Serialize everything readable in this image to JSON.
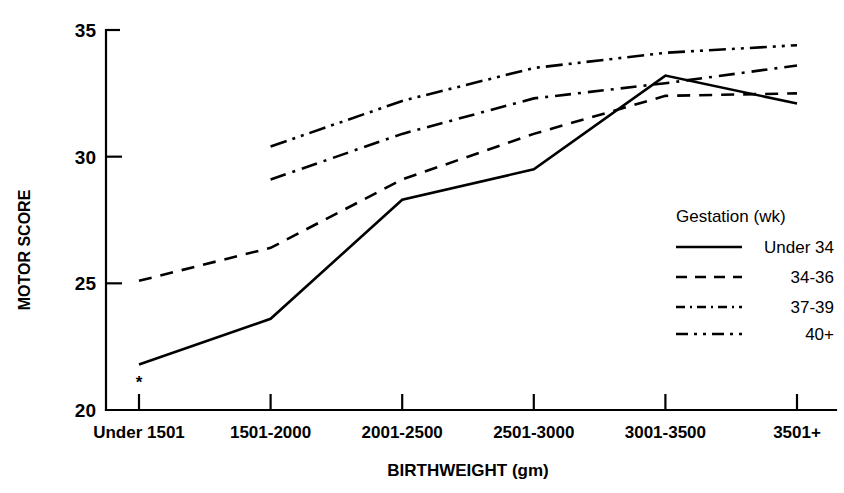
{
  "chart_data": {
    "type": "line",
    "title": "",
    "xlabel": "BIRTHWEIGHT (gm)",
    "ylabel": "MOTOR SCORE",
    "categories": [
      "Under 1501",
      "1501-2000",
      "2001-2500",
      "2501-3000",
      "3001-3500",
      "3501+"
    ],
    "ylim": [
      20,
      35
    ],
    "yticks": [
      20,
      25,
      30,
      35
    ],
    "ytick_labels": [
      "20",
      "25",
      "30",
      "35"
    ],
    "grid": false,
    "legend_position": "right-middle",
    "legend_title": "Gestation (wk)",
    "annotations": [
      {
        "name": "asterisk-marker",
        "text": "*",
        "category": "Under 1501",
        "note": "asterisk below first solid-line data point"
      }
    ],
    "series": [
      {
        "name": "Under 34",
        "style": "solid",
        "values": [
          21.8,
          23.6,
          28.3,
          29.5,
          33.2,
          32.1
        ]
      },
      {
        "name": "34-36",
        "style": "dashed",
        "values": [
          25.1,
          26.4,
          29.1,
          30.9,
          32.4,
          32.5
        ]
      },
      {
        "name": "37-39",
        "style": "dash-dot",
        "values": [
          null,
          29.1,
          30.9,
          32.3,
          32.9,
          33.6
        ]
      },
      {
        "name": "40+",
        "style": "dash-dot-dot",
        "values": [
          null,
          30.4,
          32.2,
          33.5,
          34.1,
          34.4
        ]
      }
    ]
  },
  "axes": {
    "y_title": "MOTOR SCORE",
    "x_title": "BIRTHWEIGHT (gm)",
    "y_ticks": [
      "20",
      "25",
      "30",
      "35"
    ],
    "x_ticks": [
      "Under 1501",
      "1501-2000",
      "2001-2500",
      "2501-3000",
      "3001-3500",
      "3501+"
    ]
  },
  "legend": {
    "title": "Gestation (wk)",
    "entries": [
      {
        "label": "Under 34",
        "style": "solid"
      },
      {
        "label": "34-36",
        "style": "dashed"
      },
      {
        "label": "37-39",
        "style": "dash-dot"
      },
      {
        "label": "40+",
        "style": "dash-dot-dot"
      }
    ]
  },
  "marks": {
    "asterisk": "*"
  },
  "colors": {
    "ink": "#000000",
    "background": "#ffffff"
  }
}
